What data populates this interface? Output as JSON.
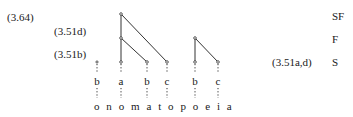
{
  "labels": {
    "eq_364": "(3.64)",
    "eq_351d": "(3.51d)",
    "eq_351b": "(3.51b)",
    "eq_351ad": "(3.51a,d)"
  },
  "tiers": {
    "sf": "SF",
    "f": "F",
    "s": "S"
  },
  "syllable_row": [
    {
      "letter": "b"
    },
    {
      "letter": "a"
    },
    {
      "letter": "b"
    },
    {
      "letter": "c"
    },
    {
      "letter": "b"
    },
    {
      "letter": "c"
    }
  ],
  "word": "o n o m a t o p o e i a"
}
